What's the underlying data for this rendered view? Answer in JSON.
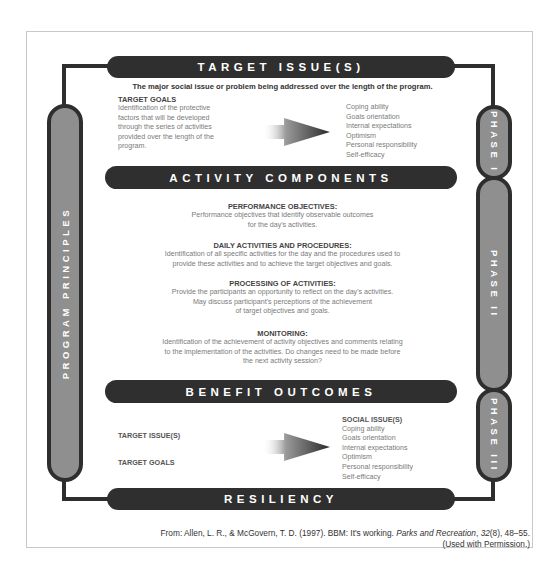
{
  "diagram": {
    "top_banner": {
      "label": "TARGET ISSUE(S)"
    },
    "subtitle": "The major social issue or problem being addressed over the length of the program.",
    "target_goals": {
      "title": "TARGET GOALS",
      "lines": [
        "Identification of the protective",
        "factors that will be developed",
        "through the series of activities",
        "provided over the length of the",
        "program."
      ]
    },
    "protective_factors": [
      "Coping ability",
      "Goals orientation",
      "Internal expectations",
      "Optimism",
      "Personal responsibility",
      "Self-efficacy"
    ],
    "activity_banner": {
      "label": "ACTIVITY COMPONENTS"
    },
    "activity_sections": [
      {
        "title": "PERFORMANCE OBJECTIVES:",
        "lines": [
          "Performance objectives that identify observable outcomes",
          "for the day's activities."
        ]
      },
      {
        "title": "DAILY ACTIVITIES AND PROCEDURES:",
        "lines": [
          "Identification of all specific activities for the day and the procedures used to",
          "provide these activities and to achieve the target objectives and goals."
        ]
      },
      {
        "title": "PROCESSING OF ACTIVITIES:",
        "lines": [
          "Provide the participants an opportunity to reflect on the day's activities.",
          "May discuss participant's perceptions of the achievement",
          "of target objectives and goals."
        ]
      },
      {
        "title": "MONITORING:",
        "lines": [
          "Identification of the achievement of activity objectives and comments relating",
          "to the implementation of the activities. Do changes need to be made before",
          "the next activity session?"
        ]
      }
    ],
    "benefit_banner": {
      "label": "BENEFIT OUTCOMES"
    },
    "benefit_inputs": [
      "TARGET ISSUE(S)",
      "TARGET GOALS"
    ],
    "benefit_results": {
      "title": "SOCIAL ISSUE(S)",
      "items": [
        "Coping ability",
        "Goals orientation",
        "Internal expectations",
        "Optimism",
        "Personal responsibility",
        "Self-efficacy"
      ]
    },
    "bottom_banner": {
      "label": "RESILIENCY"
    },
    "left_pillar": {
      "label": "PROGRAM PRINCIPLES"
    },
    "phases": [
      {
        "label": "PHASE I"
      },
      {
        "label": "PHASE II"
      },
      {
        "label": "PHASE III"
      }
    ],
    "colors": {
      "banner": "#2f2f2f",
      "pillar_fill": "#8f8f8f",
      "pillar_border": "#2e2e2e",
      "body_text": "#7a7a7a"
    }
  },
  "caption": {
    "line1_prefix": "From: Allen, L. R., & McGovern, T. D. (1997). BBM: It's working. ",
    "journal": "Parks and Recreation",
    "volume_sep": ", ",
    "volume": "32",
    "issue_pages": "(8), 48–55.",
    "line2": "(Used with Permission.)"
  }
}
